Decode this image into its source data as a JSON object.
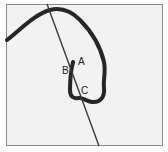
{
  "figure": {
    "labels": [
      {
        "id": "A",
        "text": "A",
        "x": 78,
        "y": 57
      },
      {
        "id": "B",
        "text": "B",
        "x": 62,
        "y": 66
      },
      {
        "id": "C",
        "text": "C",
        "x": 81,
        "y": 86
      }
    ],
    "colors": {
      "background": "#f2f2f2",
      "border": "#8a8a8a",
      "yarn": "#262626",
      "needle": "#3a3a3a"
    }
  }
}
